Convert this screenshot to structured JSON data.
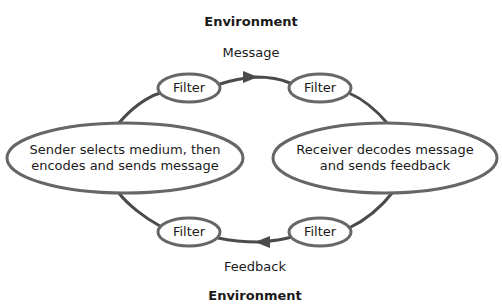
{
  "diagram": {
    "environment_top": "Environment",
    "environment_bottom": "Environment",
    "message_label": "Message",
    "feedback_label": "Feedback",
    "sender": {
      "line1": "Sender selects medium, then",
      "line2": "encodes and sends message"
    },
    "receiver": {
      "line1": "Receiver decodes message",
      "line2": "and sends feedback"
    },
    "filters": {
      "top_left": "Filter",
      "top_right": "Filter",
      "bottom_left": "Filter",
      "bottom_right": "Filter"
    },
    "colors": {
      "stroke": "#666666",
      "line": "#4a4a4a",
      "text": "#1a1a1a"
    }
  }
}
